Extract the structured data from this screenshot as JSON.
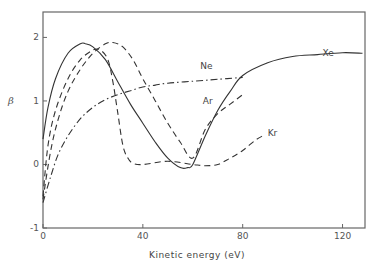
{
  "chart_data": {
    "type": "line",
    "title": "",
    "xlabel": "Kinetic energy (eV)",
    "ylabel": "β",
    "xlim": [
      0,
      129
    ],
    "ylim": [
      -1,
      2.4
    ],
    "x_ticks": [
      0,
      40,
      80,
      120
    ],
    "y_ticks": [
      -1,
      0,
      1,
      2
    ],
    "x_tick_labels": [
      "0",
      "40",
      "80",
      "120"
    ],
    "y_tick_labels": [
      "-1",
      "0",
      "1",
      "2"
    ],
    "grid": false,
    "legend": "inline labels",
    "series": [
      {
        "name": "Xe",
        "style": "solid",
        "x": [
          0,
          2,
          5,
          10,
          15,
          17,
          20,
          25,
          30,
          35,
          40,
          45,
          50,
          55,
          58,
          60,
          65,
          70,
          75,
          80,
          90,
          100,
          110,
          120,
          128
        ],
        "y": [
          0.4,
          0.9,
          1.35,
          1.75,
          1.9,
          1.9,
          1.85,
          1.65,
          1.3,
          0.95,
          0.65,
          0.35,
          0.1,
          -0.05,
          -0.05,
          0.0,
          0.45,
          0.85,
          1.15,
          1.4,
          1.6,
          1.7,
          1.73,
          1.76,
          1.75
        ]
      },
      {
        "name": "Kr",
        "style": "dashed",
        "x": [
          0,
          2,
          5,
          10,
          15,
          20,
          23,
          26,
          28,
          30,
          32,
          34,
          36,
          40,
          50,
          60,
          65,
          70,
          75,
          80,
          85,
          88
        ],
        "y": [
          -0.5,
          0.3,
          0.85,
          1.35,
          1.65,
          1.8,
          1.8,
          1.65,
          1.3,
          0.8,
          0.3,
          0.1,
          0.02,
          0.0,
          0.05,
          0.0,
          -0.02,
          0.0,
          0.1,
          0.22,
          0.38,
          0.45
        ]
      },
      {
        "name": "Ar",
        "style": "dashed",
        "x": [
          0,
          3,
          6,
          10,
          15,
          20,
          25,
          28,
          32,
          36,
          40,
          45,
          50,
          55,
          60,
          65,
          70,
          75,
          80
        ],
        "y": [
          -0.55,
          0.2,
          0.7,
          1.15,
          1.5,
          1.75,
          1.9,
          1.92,
          1.85,
          1.65,
          1.35,
          1.0,
          0.65,
          0.35,
          0.1,
          0.55,
          0.8,
          0.95,
          1.1
        ]
      },
      {
        "name": "Ne",
        "style": "dash-dot",
        "x": [
          0,
          3,
          6,
          10,
          15,
          20,
          25,
          30,
          35,
          40,
          45,
          50,
          60,
          70,
          80
        ],
        "y": [
          -0.6,
          -0.2,
          0.15,
          0.45,
          0.72,
          0.9,
          1.02,
          1.1,
          1.16,
          1.22,
          1.25,
          1.28,
          1.31,
          1.34,
          1.37
        ]
      }
    ],
    "annotations": [
      {
        "text": "Xe",
        "x": 112,
        "y": 1.7
      },
      {
        "text": "Ne",
        "x": 63,
        "y": 1.5
      },
      {
        "text": "Ar",
        "x": 64,
        "y": 0.95
      },
      {
        "text": "Kr",
        "x": 90,
        "y": 0.45
      }
    ]
  }
}
